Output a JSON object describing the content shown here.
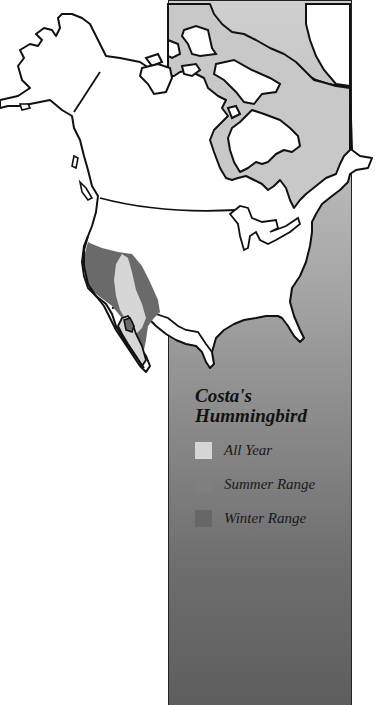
{
  "map": {
    "region": "North America",
    "species": "Costa's Hummingbird"
  },
  "legend": {
    "title_line1": "Costa's",
    "title_line2": "Hummingbird",
    "items": [
      {
        "label": "All Year",
        "color": "#d6d6d6"
      },
      {
        "label": "Summer Range",
        "color": "#7f7f7f"
      },
      {
        "label": "Winter Range",
        "color": "#676767"
      }
    ]
  },
  "colors": {
    "land": "#ffffff",
    "outline": "#111111",
    "all_year": "#d6d6d6",
    "winter_range": "#6a6a6a",
    "panel_top": "#cfcfcf",
    "panel_bottom": "#5e5e5e"
  }
}
